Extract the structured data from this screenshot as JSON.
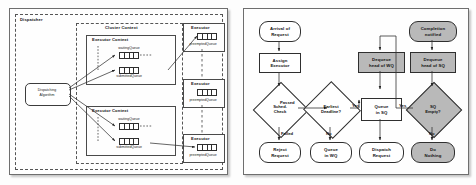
{
  "left_panel": {
    "name": "dispatcher-architecture-diagram",
    "dispatcher_label": "Dispatcher",
    "cluster_context_label": "Cluster Context",
    "dispatching_algorithm_label": "Dispatching\nAlgorithm",
    "dispatching_algorithm_line1": "Dispatching",
    "dispatching_algorithm_line2": "Algorithm",
    "executor_contexts": [
      {
        "title": "Executor Context",
        "queues": [
          {
            "label": "waitingQueue",
            "cells": 4
          },
          {
            "label": "submittedQueue",
            "cells": 4
          }
        ]
      },
      {
        "title": "Executor Context",
        "queues": [
          {
            "label": "waitingQueue",
            "cells": 4
          },
          {
            "label": "submittedQueue",
            "cells": 4
          }
        ]
      }
    ],
    "executors": [
      {
        "title": "Executor",
        "queue_label": "preemptedQueue",
        "cells": 4
      },
      {
        "title": "Executor",
        "queue_label": "preemptedQueue",
        "cells": 4
      },
      {
        "title": "Executor",
        "queue_label": "preemptedQueue",
        "cells": 4
      }
    ]
  },
  "right_panel": {
    "name": "request-dispatch-flowchart",
    "nodes": {
      "arrival_of_request": "Arrival of\nRequest",
      "arrival_l1": "Arrival of",
      "arrival_l2": "Request",
      "assign_executor_l1": "Assign",
      "assign_executor_l2": "Executor",
      "sched_check_l1": "Sched.",
      "sched_check_l2": "Check",
      "reject_request_l1": "Reject",
      "reject_request_l2": "Request",
      "earliest_deadline_l1": "Earliest",
      "earliest_deadline_l2": "Deadline?",
      "queue_in_wq_l1": "Queue",
      "queue_in_wq_l2": "in WQ",
      "queue_in_sq_l1": "Queue",
      "queue_in_sq_l2": "in SQ",
      "dispatch_request_l1": "Dispatch",
      "dispatch_request_l2": "Request",
      "dequeue_head_wq_l1": "Dequeue",
      "dequeue_head_wq_l2": "head of WQ",
      "completion_notified_l1": "Completion",
      "completion_notified_l2": "notified",
      "dequeue_head_sq_l1": "Dequeue",
      "dequeue_head_sq_l2": "head of SQ",
      "sq_empty_l1": "SQ",
      "sq_empty_l2": "Empty?",
      "do_nothing_l1": "Do",
      "do_nothing_l2": "Nothing"
    },
    "edge_labels": {
      "passed": "Passed",
      "failed": "Failed",
      "deadline_yes": "Yes",
      "deadline_no": "No",
      "sq_yes": "Yes",
      "sq_no": "No"
    }
  },
  "colors": {
    "panel_border": "#6e6e6e",
    "node_stroke": "#2f2f2f",
    "node_fill": "#ffffff",
    "node_fill_gray": "#b9b9b9",
    "background": "#fdfdfd"
  }
}
